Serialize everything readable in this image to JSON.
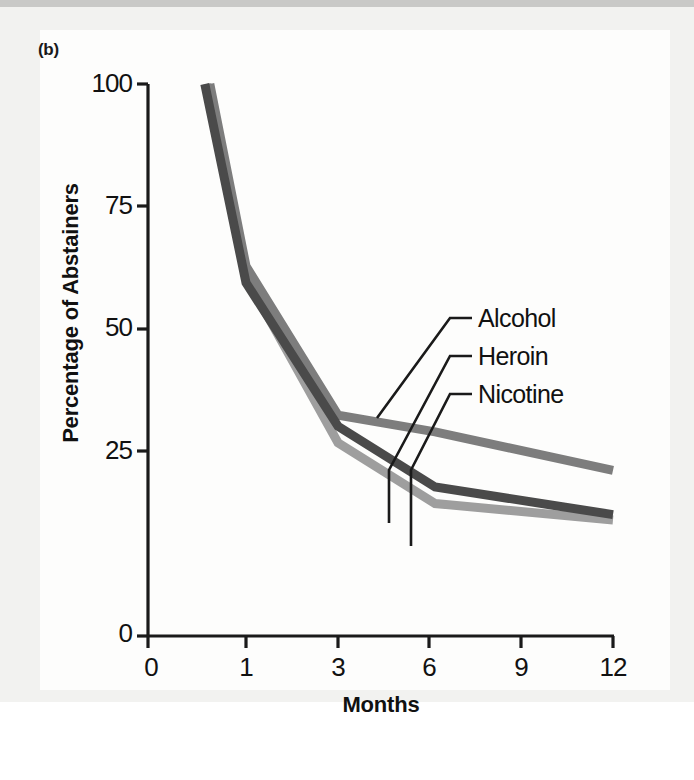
{
  "panel": {
    "label": "(b)"
  },
  "axes": {
    "ylabel": "Percentage of Abstainers",
    "xlabel": "Months",
    "yticks": [
      "100",
      "75",
      "50",
      "25",
      "0"
    ],
    "xticks": [
      "0",
      "1",
      "3",
      "6",
      "9",
      "12"
    ]
  },
  "legend": {
    "items": [
      {
        "name": "alcohol",
        "label": "Alcohol",
        "color": "#7d7d7d"
      },
      {
        "name": "heroin",
        "label": "Heroin",
        "color": "#4a4a4a"
      },
      {
        "name": "nicotine",
        "label": "Nicotine",
        "color": "#9e9e9e"
      }
    ]
  },
  "chart_data": {
    "type": "line",
    "title": "",
    "xlabel": "Months",
    "ylabel": "Percentage of Abstainers",
    "xlim": [
      0,
      12
    ],
    "ylim": [
      0,
      100
    ],
    "yticks": [
      0,
      25,
      50,
      75,
      100
    ],
    "xticks": [
      0,
      1,
      3,
      6,
      9,
      12
    ],
    "x_axis_scale": "ordinal",
    "grid": false,
    "legend_position": "inline-leader-lines",
    "x": [
      0.6,
      1,
      3,
      6.2,
      12
    ],
    "series": [
      {
        "name": "Alcohol",
        "color": "#7d7d7d",
        "values": [
          100,
          67,
          40,
          37,
          30
        ]
      },
      {
        "name": "Heroin",
        "color": "#4a4a4a",
        "values": [
          100,
          64,
          38,
          27,
          22
        ]
      },
      {
        "name": "Nicotine",
        "color": "#9e9e9e",
        "values": [
          100,
          65,
          35,
          24,
          21
        ]
      }
    ]
  }
}
